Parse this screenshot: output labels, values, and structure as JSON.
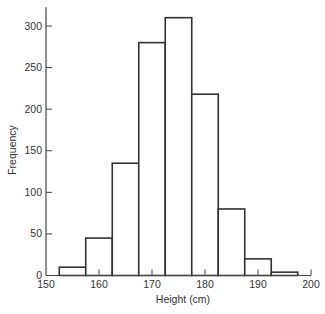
{
  "chart_data": {
    "type": "bar",
    "subtype": "histogram",
    "title": "",
    "xlabel": "Height (cm)",
    "ylabel": "Frequency",
    "xlim": [
      150,
      200
    ],
    "ylim": [
      0,
      320
    ],
    "xticks": [
      150,
      160,
      170,
      180,
      190,
      200
    ],
    "yticks": [
      0,
      50,
      100,
      150,
      200,
      250,
      300
    ],
    "bin_width": 5,
    "bins": [
      {
        "start": 152.5,
        "end": 157.5,
        "value": 10
      },
      {
        "start": 157.5,
        "end": 162.5,
        "value": 45
      },
      {
        "start": 162.5,
        "end": 167.5,
        "value": 135
      },
      {
        "start": 167.5,
        "end": 172.5,
        "value": 280
      },
      {
        "start": 172.5,
        "end": 177.5,
        "value": 310
      },
      {
        "start": 177.5,
        "end": 182.5,
        "value": 218
      },
      {
        "start": 182.5,
        "end": 187.5,
        "value": 80
      },
      {
        "start": 187.5,
        "end": 192.5,
        "value": 20
      },
      {
        "start": 192.5,
        "end": 197.5,
        "value": 4
      }
    ],
    "categories": [
      "152.5-157.5",
      "157.5-162.5",
      "162.5-167.5",
      "167.5-172.5",
      "172.5-177.5",
      "177.5-182.5",
      "182.5-187.5",
      "187.5-192.5",
      "192.5-197.5"
    ],
    "values": [
      10,
      45,
      135,
      280,
      310,
      218,
      80,
      20,
      4
    ],
    "grid": false,
    "legend": null
  },
  "colors": {
    "bar_fill": "#ffffff",
    "bar_stroke": "#333333",
    "axis": "#444444",
    "text": "#333333"
  }
}
